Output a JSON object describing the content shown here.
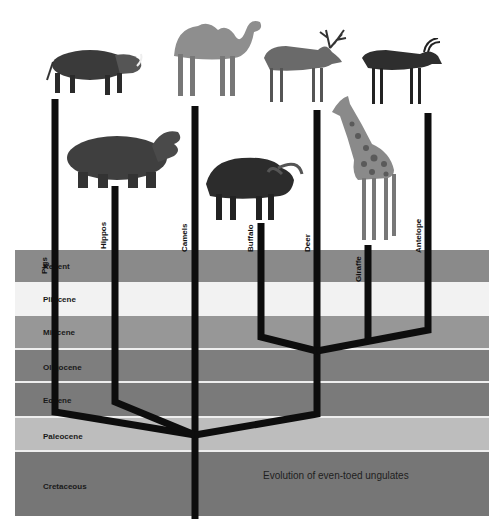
{
  "title": "Evolution of even-toed ungulates",
  "periods": [
    {
      "name": "Recent",
      "top": 250,
      "height": 32,
      "color": "#8a8a8a"
    },
    {
      "name": "Pliocene",
      "top": 282,
      "height": 34,
      "color": "#f2f2f2"
    },
    {
      "name": "Miocene",
      "top": 316,
      "height": 33,
      "color": "#979797"
    },
    {
      "name": "Oligocene",
      "top": 349,
      "height": 33,
      "color": "#7e7e7e"
    },
    {
      "name": "Eocene",
      "top": 382,
      "height": 35,
      "color": "#7a7a7a"
    },
    {
      "name": "Paleocene",
      "top": 417,
      "height": 34,
      "color": "#bdbdbd"
    },
    {
      "name": "Cretaceous",
      "top": 451,
      "height": 65,
      "color": "#767676"
    }
  ],
  "lineages": [
    {
      "name": "Pigs",
      "animal": "warthog",
      "x": 55,
      "top": 99
    },
    {
      "name": "Hippos",
      "animal": "hippopotamus",
      "x": 115,
      "top": 186
    },
    {
      "name": "Camels",
      "animal": "camel",
      "x": 195,
      "top": 106
    },
    {
      "name": "Buffalo",
      "animal": "buffalo",
      "x": 261,
      "top": 223
    },
    {
      "name": "Deer",
      "animal": "deer",
      "x": 316,
      "top": 110
    },
    {
      "name": "Giraffe",
      "animal": "giraffe",
      "x": 368,
      "top": 245
    },
    {
      "name": "Antelope",
      "animal": "antelope",
      "x": 428,
      "top": 113
    }
  ],
  "colors": {
    "branch": "#0d0d0d",
    "separator": "#eeeeee",
    "background": "#ffffff"
  }
}
